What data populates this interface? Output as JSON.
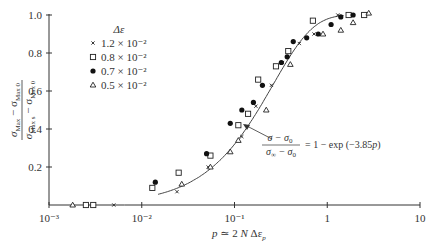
{
  "chart_data": {
    "type": "scatter",
    "title": "",
    "xlabel": "p ≃ 2 N Δε_p",
    "ylabel": "(σ_Max − σ_Max 0) / (σ_Max s − σ_Max 0)",
    "xscale": "log",
    "xlim": [
      0.001,
      10
    ],
    "ylim": [
      0,
      1.0
    ],
    "x_ticks": [
      "10⁻³",
      "10⁻²",
      "10⁻¹",
      "1",
      "10"
    ],
    "y_ticks": [
      "0.2",
      "0.4",
      "0.6",
      "0.8",
      "1.0"
    ],
    "grid": false,
    "legend": {
      "title": "Δε",
      "position": "upper-left",
      "entries": [
        {
          "marker": "cross",
          "label": "1.2 × 10⁻²"
        },
        {
          "marker": "square",
          "label": "0.8 × 10⁻²"
        },
        {
          "marker": "filled-circle",
          "label": "0.7 × 10⁻²"
        },
        {
          "marker": "triangle",
          "label": "0.5 × 10⁻²"
        }
      ]
    },
    "series": [
      {
        "name": "1.2 × 10⁻²",
        "marker": "cross",
        "points": [
          [
            0.005,
            0.0
          ],
          [
            0.024,
            0.07
          ],
          [
            0.052,
            0.2
          ],
          [
            0.12,
            0.36
          ],
          [
            0.17,
            0.52
          ],
          [
            0.25,
            0.63
          ],
          [
            0.33,
            0.75
          ],
          [
            0.5,
            0.85
          ],
          [
            0.72,
            0.9
          ],
          [
            1.3,
            1.0
          ],
          [
            1.8,
            1.0
          ]
        ]
      },
      {
        "name": "0.8 × 10⁻²",
        "marker": "square",
        "points": [
          [
            0.0025,
            0.0
          ],
          [
            0.003,
            0.0
          ],
          [
            0.013,
            0.09
          ],
          [
            0.025,
            0.17
          ],
          [
            0.055,
            0.26
          ],
          [
            0.11,
            0.42
          ],
          [
            0.14,
            0.48
          ],
          [
            0.18,
            0.66
          ],
          [
            0.28,
            0.73
          ],
          [
            0.38,
            0.81
          ],
          [
            0.7,
            0.97
          ],
          [
            1.7,
            1.0
          ],
          [
            2.5,
            1.0
          ]
        ]
      },
      {
        "name": "0.7 × 10⁻²",
        "marker": "filled-circle",
        "points": [
          [
            0.014,
            0.12
          ],
          [
            0.05,
            0.27
          ],
          [
            0.09,
            0.43
          ],
          [
            0.12,
            0.5
          ],
          [
            0.16,
            0.54
          ],
          [
            0.2,
            0.63
          ],
          [
            0.32,
            0.75
          ],
          [
            0.37,
            0.78
          ],
          [
            0.43,
            0.86
          ],
          [
            0.6,
            0.88
          ],
          [
            0.8,
            0.9
          ],
          [
            1.1,
            0.95
          ],
          [
            1.4,
            0.99
          ],
          [
            1.9,
            1.0
          ]
        ]
      },
      {
        "name": "0.5 × 10⁻²",
        "marker": "triangle",
        "points": [
          [
            0.0018,
            0.0
          ],
          [
            0.027,
            0.11
          ],
          [
            0.055,
            0.2
          ],
          [
            0.09,
            0.28
          ],
          [
            0.11,
            0.34
          ],
          [
            0.22,
            0.5
          ],
          [
            0.4,
            0.74
          ],
          [
            0.9,
            0.9
          ],
          [
            1.4,
            0.92
          ],
          [
            1.9,
            0.96
          ],
          [
            2.8,
            1.01
          ]
        ]
      }
    ],
    "fit_curve": {
      "equation": "(σ − σ₀)/(σ∞ − σ₀) = 1 − exp(−3.85 p)",
      "coefficient": 3.85,
      "p_range": [
        0.015,
        1.5
      ]
    },
    "annotations": [
      {
        "text": "(σ − σ₀)/(σ∞ − σ₀) = 1 − exp (−3.85 p)",
        "arrow_to": [
          0.2,
          0.54
        ]
      }
    ]
  },
  "labels": {
    "ylabel_top": "σ",
    "ylabel_top_sub": "Max",
    "ylabel_top_sep": " − σ",
    "ylabel_top_sub2": "Max 0",
    "ylabel_bot": "σ",
    "ylabel_bot_sub": "Max s",
    "ylabel_bot_sep": " − σ",
    "ylabel_bot_sub2": "Max 0",
    "xlabel_p": "p",
    "xlabel_rest": " ≃ 2 ",
    "xlabel_N": "N",
    "xlabel_d": " Δε",
    "xlabel_sub": "p",
    "legend_title": "Δε",
    "annot_num": "σ − σ",
    "annot_num_sub": "0",
    "annot_den": "σ",
    "annot_den_inf": "∞",
    "annot_den_rest": " − σ",
    "annot_den_sub": "0",
    "annot_rhs": "= 1 − exp (−3.85",
    "annot_p": "p",
    "annot_close": ")"
  }
}
